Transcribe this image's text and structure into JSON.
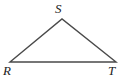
{
  "figure": {
    "name": "triangle-rst",
    "type": "geometry-diagram",
    "background_color": "#ffffff",
    "stroke_color": "#4a4a4a",
    "label_color": "#1c1c1c",
    "labels": {
      "apex": "S",
      "bottom_left": "R",
      "bottom_right": "T"
    },
    "vertices": [
      {
        "id": "S",
        "label": "S",
        "x": 62,
        "y": 19
      },
      {
        "id": "R",
        "label": "R",
        "x": 10,
        "y": 62
      },
      {
        "id": "T",
        "label": "T",
        "x": 116,
        "y": 62
      }
    ],
    "edges": [
      {
        "from": "R",
        "to": "S"
      },
      {
        "from": "S",
        "to": "T"
      },
      {
        "from": "R",
        "to": "T"
      }
    ],
    "polygon_points": "10,62 62,19 116,62",
    "stroke_width": 1.4
  }
}
